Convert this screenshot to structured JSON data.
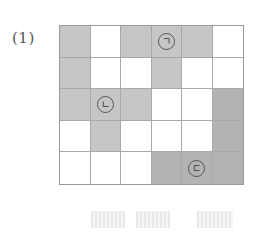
{
  "problem": {
    "label": "(1)",
    "grid": {
      "rows": 5,
      "cols": 6,
      "cells": [
        [
          "g",
          "w",
          "g",
          "g",
          "g",
          "w"
        ],
        [
          "g",
          "w",
          "w",
          "g",
          "w",
          "w"
        ],
        [
          "g",
          "g",
          "g",
          "w",
          "w",
          "d"
        ],
        [
          "w",
          "g",
          "w",
          "w",
          "w",
          "d"
        ],
        [
          "w",
          "w",
          "w",
          "d",
          "d",
          "d"
        ]
      ],
      "marks": [
        {
          "row": 0,
          "col": 3,
          "text": "ㄱ"
        },
        {
          "row": 2,
          "col": 1,
          "text": "ㄴ"
        },
        {
          "row": 4,
          "col": 4,
          "text": "ㄷ"
        }
      ]
    },
    "answer_blanks": [
      {
        "left": 91,
        "width": 34
      },
      {
        "left": 136,
        "width": 34
      },
      {
        "left": 197,
        "width": 36
      }
    ]
  }
}
